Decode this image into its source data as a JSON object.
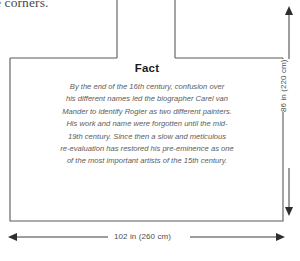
{
  "caption": {
    "fragment_text": "e corners."
  },
  "fact_panel": {
    "title": "Fact",
    "lines": [
      "By the end of the 16th century, confusion over",
      "his different names led the biographer Carel van",
      "Mander to identify Rogier as two different painters.",
      "His work and name were forgotten until the mid-",
      "19th century. Since then a slow and meticulous",
      "re-evaluation has restored his pre-eminence as one",
      "of the most important artists of the 15th century."
    ]
  },
  "dimensions": {
    "width_label": "102 in (260 cm)",
    "height_label": "86 in (220 cm)"
  },
  "colors": {
    "outline": "#5a5a5a",
    "dimension_line": "#3c3c3c",
    "text": "#5c5c5c",
    "title_text": "#1d1d1d",
    "background": "#ffffff"
  },
  "icons": {
    "arrow_left": "arrow-left-icon",
    "arrow_right": "arrow-right-icon",
    "arrow_up": "arrow-up-icon",
    "arrow_down": "arrow-down-icon"
  }
}
